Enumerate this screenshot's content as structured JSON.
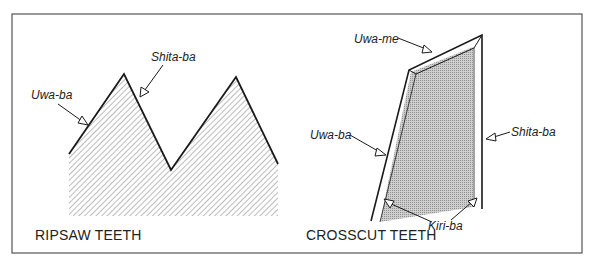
{
  "figure": {
    "panels": [
      {
        "id": "ripsaw",
        "caption": "RIPSAW TEETH",
        "labels": {
          "upper_face": "Uwa-ba",
          "lower_face": "Shita-ba"
        }
      },
      {
        "id": "crosscut",
        "caption": "CROSSCUT TEETH",
        "labels": {
          "top_bevel": "Uwa-me",
          "upper_face": "Uwa-ba",
          "lower_face": "Shita-ba",
          "cutting_edge": "Kiri-ba"
        }
      }
    ],
    "colors": {
      "line": "#1a1a1a",
      "border": "#555555",
      "hatch": "#8a8a8a",
      "background": "#ffffff"
    }
  }
}
